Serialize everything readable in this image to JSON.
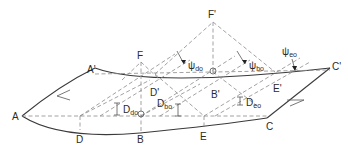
{
  "diagram": {
    "colors": {
      "line": "#3a3a3a",
      "dashed": "#8a8a8a",
      "text": "#2a2a2a",
      "background": "#ffffff"
    },
    "points": {
      "A": "A",
      "A_prime": "A'",
      "B": "B",
      "B_prime": "B'",
      "C": "C",
      "C_prime": "C'",
      "D": "D",
      "D_prime": "D'",
      "E": "E",
      "E_prime": "E'",
      "F": "F",
      "F_prime": "F'"
    },
    "angles": {
      "psi_do": {
        "symbol": "ψ",
        "sub": "do"
      },
      "psi_bo": {
        "symbol": "ψ",
        "sub": "bo"
      },
      "psi_eo": {
        "symbol": "ψ",
        "sub": "eo"
      }
    },
    "depths": {
      "D_do": {
        "symbol": "D",
        "sub": "do"
      },
      "D_bo": {
        "symbol": "D",
        "sub": "bo"
      },
      "D_eo": {
        "symbol": "D",
        "sub": "eo"
      }
    }
  }
}
